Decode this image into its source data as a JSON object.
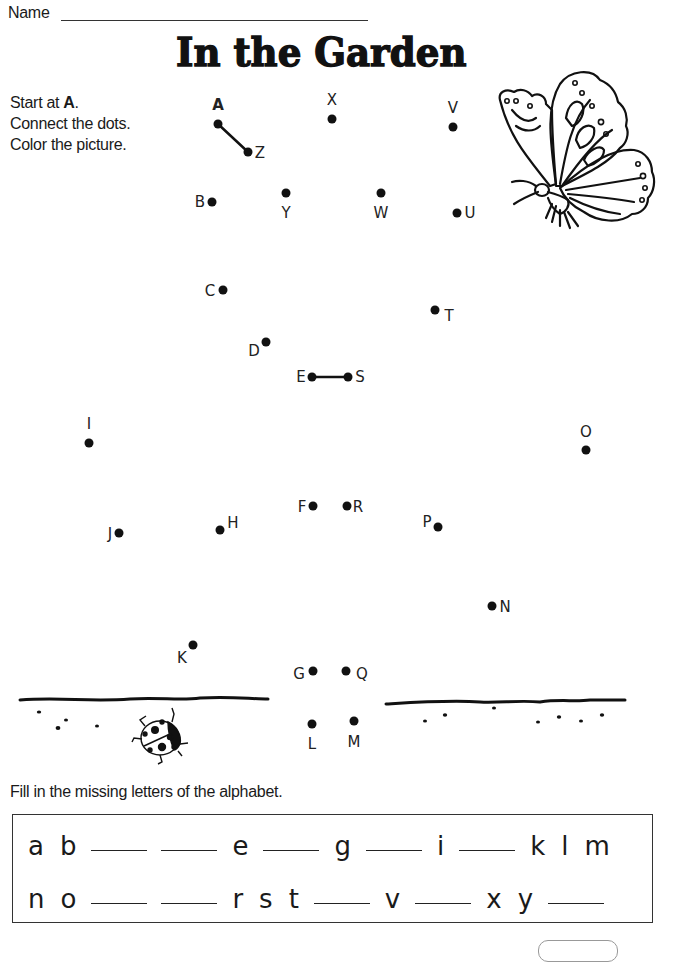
{
  "header": {
    "name_label": "Name",
    "title": "In the Garden"
  },
  "instructions": {
    "line1_prefix": "Start at ",
    "line1_bold": "A",
    "line1_suffix": ".",
    "line2": "Connect the dots.",
    "line3": "Color the picture."
  },
  "dots": [
    {
      "letter": "A",
      "x": 218,
      "y": 124,
      "lx": 218,
      "ly": 105,
      "bold": true
    },
    {
      "letter": "B",
      "x": 212,
      "y": 202,
      "lx": 200,
      "ly": 202
    },
    {
      "letter": "C",
      "x": 223,
      "y": 290,
      "lx": 210,
      "ly": 291
    },
    {
      "letter": "D",
      "x": 266,
      "y": 342,
      "lx": 254,
      "ly": 351
    },
    {
      "letter": "E",
      "x": 312,
      "y": 377,
      "lx": 301,
      "ly": 377
    },
    {
      "letter": "F",
      "x": 313,
      "y": 506,
      "lx": 302,
      "ly": 507
    },
    {
      "letter": "G",
      "x": 313,
      "y": 671,
      "lx": 299,
      "ly": 674
    },
    {
      "letter": "H",
      "x": 220,
      "y": 530,
      "lx": 233,
      "ly": 523
    },
    {
      "letter": "I",
      "x": 89,
      "y": 443,
      "lx": 89,
      "ly": 424
    },
    {
      "letter": "J",
      "x": 119,
      "y": 533,
      "lx": 110,
      "ly": 534
    },
    {
      "letter": "K",
      "x": 193,
      "y": 645,
      "lx": 182,
      "ly": 658
    },
    {
      "letter": "L",
      "x": 312,
      "y": 724,
      "lx": 312,
      "ly": 744
    },
    {
      "letter": "M",
      "x": 354,
      "y": 721,
      "lx": 354,
      "ly": 742
    },
    {
      "letter": "N",
      "x": 492,
      "y": 606,
      "lx": 505,
      "ly": 607
    },
    {
      "letter": "O",
      "x": 586,
      "y": 450,
      "lx": 586,
      "ly": 432
    },
    {
      "letter": "P",
      "x": 438,
      "y": 527,
      "lx": 427,
      "ly": 522
    },
    {
      "letter": "Q",
      "x": 346,
      "y": 671,
      "lx": 362,
      "ly": 674
    },
    {
      "letter": "R",
      "x": 347,
      "y": 506,
      "lx": 358,
      "ly": 507
    },
    {
      "letter": "S",
      "x": 348,
      "y": 377,
      "lx": 360,
      "ly": 377
    },
    {
      "letter": "T",
      "x": 435,
      "y": 310,
      "lx": 449,
      "ly": 316
    },
    {
      "letter": "U",
      "x": 457,
      "y": 213,
      "lx": 470,
      "ly": 213
    },
    {
      "letter": "V",
      "x": 453,
      "y": 127,
      "lx": 453,
      "ly": 108
    },
    {
      "letter": "W",
      "x": 381,
      "y": 193,
      "lx": 381,
      "ly": 213
    },
    {
      "letter": "X",
      "x": 332,
      "y": 119,
      "lx": 332,
      "ly": 100
    },
    {
      "letter": "Y",
      "x": 286,
      "y": 193,
      "lx": 286,
      "ly": 213
    },
    {
      "letter": "Z",
      "x": 248,
      "y": 152,
      "lx": 260,
      "ly": 153
    }
  ],
  "connected_segments": [
    [
      "A",
      "Z"
    ],
    [
      "E",
      "S"
    ]
  ],
  "fill_prompt": "Fill in the missing letters of the alphabet.",
  "alphabet_rows": [
    [
      "a",
      "b",
      "_",
      "_",
      "e",
      "_",
      "g",
      "_",
      "i",
      "_",
      "k",
      "l",
      "m"
    ],
    [
      "n",
      "o",
      "_",
      "_",
      "r",
      "s",
      "t",
      "_",
      "v",
      "_",
      "x",
      "y",
      "_"
    ]
  ],
  "illustrations": {
    "top_right": "butterfly",
    "bottom_left": "ladybug",
    "ground": "grass-lines"
  }
}
